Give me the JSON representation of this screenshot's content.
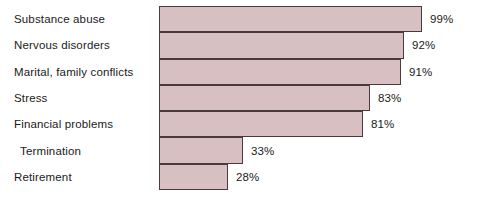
{
  "chart_data": {
    "type": "bar",
    "orientation": "horizontal",
    "title": "",
    "subtitle": "",
    "xlabel": "",
    "ylabel": "",
    "xlim": [
      0,
      100
    ],
    "grid": false,
    "legend": null,
    "value_suffix": "%",
    "categories": [
      "Substance abuse",
      "Nervous disorders",
      "Marital, family conflicts",
      "Stress",
      "Financial problems",
      "Termination",
      "Retirement"
    ],
    "values": [
      99,
      92,
      91,
      83,
      81,
      33,
      28
    ],
    "data_labels": [
      "99%",
      "92%",
      "91%",
      "83%",
      "81%",
      "33%",
      "28%"
    ],
    "colors": {
      "bar_fill": "#d8bfc2",
      "bar_border": "#4a3a3e",
      "text": "#1a1a1a",
      "background": "#ffffff"
    },
    "rows": [
      {
        "label": "Substance abuse",
        "value": 99,
        "data_label": "99%",
        "bar_end_px": 422,
        "indent": false
      },
      {
        "label": "Nervous disorders",
        "value": 92,
        "data_label": "92%",
        "bar_end_px": 404,
        "indent": false
      },
      {
        "label": "Marital, family conflicts",
        "value": 91,
        "data_label": "91%",
        "bar_end_px": 401,
        "indent": false
      },
      {
        "label": "Stress",
        "value": 83,
        "data_label": "83%",
        "bar_end_px": 370,
        "indent": false
      },
      {
        "label": "Financial problems",
        "value": 81,
        "data_label": "81%",
        "bar_end_px": 363,
        "indent": false
      },
      {
        "label": "Termination",
        "value": 33,
        "data_label": "33%",
        "bar_end_px": 243,
        "indent": true
      },
      {
        "label": "Retirement",
        "value": 28,
        "data_label": "28%",
        "bar_end_px": 228,
        "indent": false
      }
    ],
    "geometry": {
      "bar_left_px": 159,
      "plot_top_px": 6,
      "plot_bottom_px": 190,
      "label_gap_px": 8
    }
  }
}
